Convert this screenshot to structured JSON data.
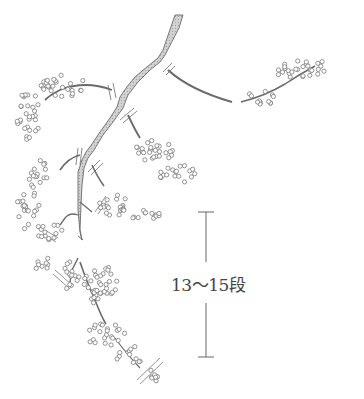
{
  "figure": {
    "annotation": {
      "label": "13〜15段",
      "position": {
        "x": 171,
        "y": 271
      },
      "bracket": {
        "x": 206,
        "top": 212,
        "bottom": 357,
        "gap_top": 262,
        "gap_bottom": 303
      }
    },
    "colors": {
      "stem_fill": "#c8c8c8",
      "stem_stroke": "#6a6a6a",
      "flower_stroke": "#7a7a7a",
      "annotation": "#555555"
    }
  }
}
